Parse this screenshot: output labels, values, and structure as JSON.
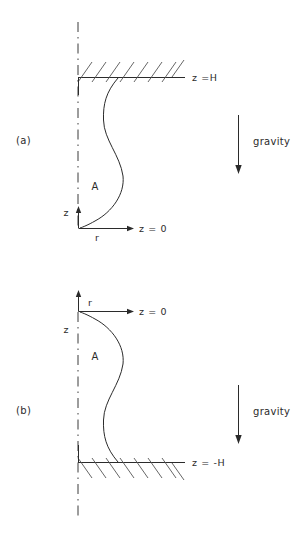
{
  "figure": {
    "title": "",
    "background": "#ffffff",
    "ink_color": "#2b2b2b",
    "width": 301,
    "height": 540
  },
  "panels": [
    {
      "id": "a",
      "label": "(a)",
      "region_label": "A",
      "boundary_label": "z =H",
      "datum_label": "z = 0",
      "axis_vertical_label": "z",
      "axis_horizontal_label": "r",
      "gravity_label": "gravity",
      "gravity_direction": "down",
      "wall_position": "top",
      "hatch_side": "above",
      "hatch_slope": "up-right",
      "centerline_style": "dash-dot"
    },
    {
      "id": "b",
      "label": "(b)",
      "region_label": "A",
      "boundary_label": "z = -H",
      "datum_label": "z = 0",
      "axis_vertical_label": "z",
      "axis_horizontal_label": "r",
      "gravity_label": "gravity",
      "gravity_direction": "down",
      "wall_position": "bottom",
      "hatch_side": "below",
      "hatch_slope": "down-right",
      "centerline_style": "dash-dot"
    }
  ]
}
